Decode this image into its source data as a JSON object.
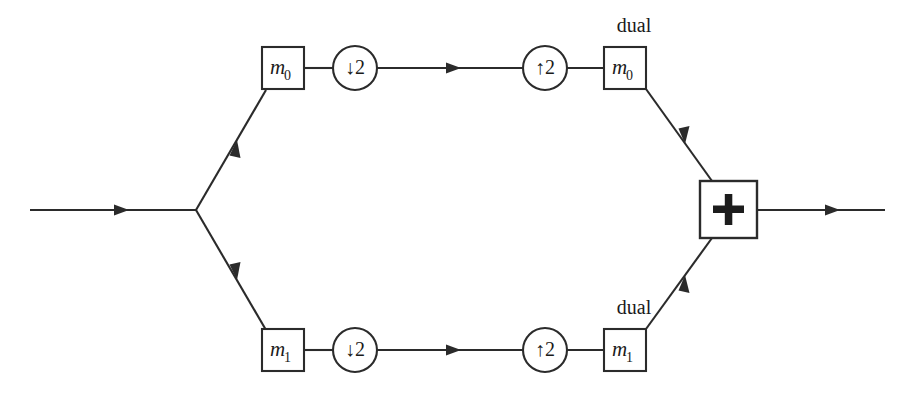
{
  "diagram": {
    "type": "signal-flow-block-diagram",
    "colors": {
      "background": "#ffffff",
      "stroke": "#2b2b2b",
      "text": "#1a1a1a"
    },
    "input": {
      "name": "input-signal-wire",
      "arrow": "right"
    },
    "output": {
      "name": "output-signal-wire",
      "arrow": "right"
    },
    "branches": [
      {
        "id": "upper",
        "analysis_filter": {
          "label": "m",
          "subscript": "0",
          "shape": "box"
        },
        "downsampler": {
          "label": "↓2",
          "factor": 2,
          "shape": "circle"
        },
        "upsampler": {
          "label": "↑2",
          "factor": 2,
          "shape": "circle"
        },
        "synthesis_filter": {
          "prefix": "dual",
          "label": "m",
          "subscript": "0",
          "shape": "box"
        }
      },
      {
        "id": "lower",
        "analysis_filter": {
          "label": "m",
          "subscript": "1",
          "shape": "box"
        },
        "downsampler": {
          "label": "↓2",
          "factor": 2,
          "shape": "circle"
        },
        "upsampler": {
          "label": "↑2",
          "factor": 2,
          "shape": "circle"
        },
        "synthesis_filter": {
          "prefix": "dual",
          "label": "m",
          "subscript": "1",
          "shape": "box"
        }
      }
    ],
    "combiner": {
      "label": "+",
      "name": "summation-block",
      "shape": "box"
    }
  }
}
